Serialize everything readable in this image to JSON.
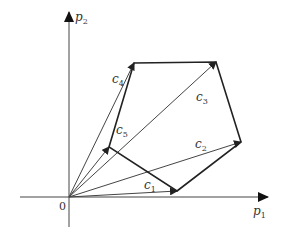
{
  "diagram": {
    "type": "vector-polygon",
    "axes": {
      "x_label": "p",
      "x_sub": "1",
      "y_label": "p",
      "y_sub": "2",
      "origin_label": "0"
    },
    "vectors": [
      {
        "name": "c",
        "sub": "1",
        "tip": [
          177,
          191
        ]
      },
      {
        "name": "c",
        "sub": "2",
        "tip": [
          241,
          142
        ]
      },
      {
        "name": "c",
        "sub": "3",
        "tip": [
          216,
          62
        ]
      },
      {
        "name": "c",
        "sub": "4",
        "tip": [
          134,
          63
        ]
      },
      {
        "name": "c",
        "sub": "5",
        "tip": [
          109,
          147
        ]
      }
    ],
    "polygon_order": [
      "c1",
      "c2",
      "c3",
      "c4",
      "c5"
    ],
    "colors": {
      "line": "#333333",
      "polygon": "#222222",
      "background": "#ffffff"
    }
  }
}
